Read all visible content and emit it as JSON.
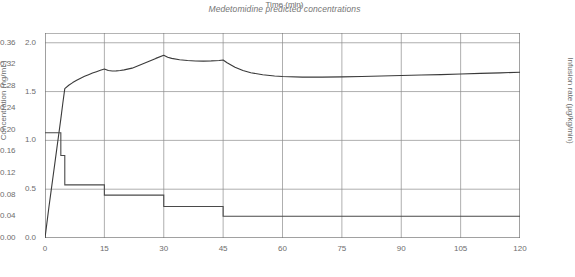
{
  "chart_data": {
    "type": "line",
    "title": "Medetomidine predicted concentrations",
    "xlabel": "Time (min)",
    "ylabel": "Concentration (ng/mL)",
    "y2label": "Infusion rate (µg/kg/min)",
    "xlim": [
      0,
      120
    ],
    "ylim": [
      0.0,
      2.1
    ],
    "y2lim": [
      0.0,
      0.378
    ],
    "grid": true,
    "legend": "none",
    "xticks": [
      0,
      15,
      30,
      45,
      60,
      75,
      90,
      105,
      120
    ],
    "xticklabels": [
      "0",
      "15",
      "30",
      "45",
      "60",
      "75",
      "90",
      "105",
      "120"
    ],
    "yticks": [
      0.0,
      0.5,
      1.0,
      1.5,
      2.0
    ],
    "yticklabels": [
      "0.0",
      "0.5",
      "1.0",
      "1.5",
      "2.0"
    ],
    "y2ticks": [
      0.0,
      0.04,
      0.08,
      0.12,
      0.16,
      0.2,
      0.24,
      0.28,
      0.32,
      0.36
    ],
    "y2ticklabels": [
      "0.00",
      "0.04",
      "0.08",
      "0.12",
      "0.16",
      "0.20",
      "0.24",
      "0.28",
      "0.32",
      "0.36"
    ],
    "series": [
      {
        "name": "Predicted concentration",
        "axis": "left",
        "units": "ng/mL",
        "color": "#3a3a3a",
        "style": "smooth",
        "x": [
          0,
          0.5,
          1,
          1.5,
          2,
          2.5,
          3,
          3.5,
          4,
          4.5,
          5,
          6,
          7,
          8,
          9,
          10,
          11,
          12,
          13,
          14,
          15,
          16,
          17,
          18,
          19,
          20,
          22,
          24,
          26,
          28,
          30,
          31,
          32,
          34,
          36,
          38,
          40,
          42,
          44,
          45,
          46,
          48,
          50,
          52,
          55,
          58,
          60,
          65,
          70,
          75,
          80,
          85,
          90,
          95,
          100,
          105,
          110,
          115,
          120
        ],
        "y": [
          0.0,
          0.16,
          0.32,
          0.47,
          0.62,
          0.77,
          0.92,
          1.07,
          1.22,
          1.38,
          1.53,
          1.565,
          1.592,
          1.615,
          1.637,
          1.656,
          1.673,
          1.69,
          1.704,
          1.718,
          1.731,
          1.716,
          1.711,
          1.712,
          1.716,
          1.722,
          1.74,
          1.772,
          1.805,
          1.84,
          1.872,
          1.852,
          1.84,
          1.826,
          1.818,
          1.813,
          1.812,
          1.814,
          1.818,
          1.823,
          1.795,
          1.75,
          1.715,
          1.693,
          1.672,
          1.659,
          1.654,
          1.648,
          1.648,
          1.651,
          1.655,
          1.66,
          1.664,
          1.669,
          1.674,
          1.68,
          1.686,
          1.692,
          1.698
        ]
      },
      {
        "name": "Infusion rate",
        "axis": "right",
        "units": "µg/kg/min",
        "color": "#4a4a4a",
        "style": "step",
        "steps": [
          {
            "t_start": 0,
            "t_end": 4,
            "rate": 0.194
          },
          {
            "t_start": 4,
            "t_end": 5,
            "rate": 0.152
          },
          {
            "t_start": 5,
            "t_end": 15,
            "rate": 0.098
          },
          {
            "t_start": 15,
            "t_end": 30,
            "rate": 0.079
          },
          {
            "t_start": 30,
            "t_end": 45,
            "rate": 0.058
          },
          {
            "t_start": 45,
            "t_end": 120,
            "rate": 0.04
          }
        ]
      }
    ]
  },
  "style": {
    "grid_color": "#8c8c8c",
    "axis_color": "#6b6b6b",
    "conc_color": "#3a3a3a",
    "rate_color": "#4a4a4a",
    "background": "#ffffff"
  }
}
